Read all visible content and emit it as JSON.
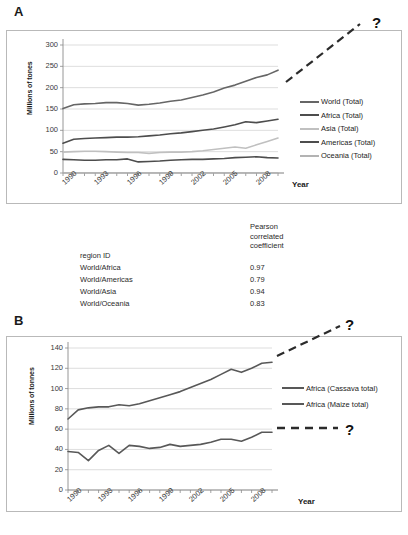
{
  "figure": {
    "panelA_letter": "A",
    "panelB_letter": "B",
    "question_mark": "?"
  },
  "table": {
    "col1_header": "region ID",
    "col2_header_line1": "Pearson",
    "col2_header_line2": "correlated",
    "col2_header_line3": "coefficient",
    "rows": [
      {
        "region": "World/Africa",
        "coefficient": "0.97"
      },
      {
        "region": "World/Americas",
        "coefficient": "0.79"
      },
      {
        "region": "World/Asia",
        "coefficient": "0.94"
      },
      {
        "region": "World/Oceania",
        "coefficient": "0.83"
      }
    ]
  },
  "chart_data": [
    {
      "id": "panelA",
      "type": "line",
      "title": "",
      "xlabel": "Year",
      "ylabel": "Millions of tones",
      "ylim": [
        0,
        300
      ],
      "yticks": [
        0,
        50,
        100,
        150,
        200,
        250,
        300
      ],
      "xlim": [
        1990,
        2010
      ],
      "xticks": [
        1990,
        1993,
        1996,
        1999,
        2002,
        2005,
        2008
      ],
      "x": [
        1990,
        1991,
        1992,
        1993,
        1994,
        1995,
        1996,
        1997,
        1998,
        1999,
        2000,
        2001,
        2002,
        2003,
        2004,
        2005,
        2006,
        2007,
        2008,
        2009,
        2010
      ],
      "grid": true,
      "legend_position": "right",
      "annotation": "?",
      "series": [
        {
          "name": "World (Total)",
          "color": "#666666",
          "width": 1.6,
          "values": [
            151,
            160,
            162,
            163,
            165,
            165,
            163,
            159,
            161,
            164,
            168,
            171,
            177,
            183,
            190,
            199,
            206,
            215,
            224,
            230,
            241
          ]
        },
        {
          "name": "Africa (Total)",
          "color": "#4d4d4d",
          "width": 1.6,
          "values": [
            70,
            79,
            81,
            82,
            83,
            84,
            84,
            85,
            87,
            89,
            92,
            94,
            97,
            100,
            103,
            108,
            113,
            120,
            118,
            122,
            126
          ]
        },
        {
          "name": "Asia (Total)",
          "color": "#c0c0c0",
          "width": 1.6,
          "values": [
            49,
            50,
            51,
            51,
            50,
            49,
            48,
            48,
            46,
            48,
            49,
            49,
            50,
            52,
            55,
            58,
            61,
            58,
            66,
            74,
            82
          ]
        },
        {
          "name": "Americas (Total)",
          "color": "#4d4d4d",
          "width": 1.6,
          "values": [
            32,
            31,
            30,
            30,
            31,
            31,
            33,
            26,
            27,
            28,
            30,
            31,
            32,
            32,
            33,
            34,
            36,
            37,
            38,
            36,
            35
          ]
        },
        {
          "name": "Oceania (Total)",
          "color": "#b3b3b3",
          "width": 1.2,
          "values": [
            0.3,
            0.3,
            0.3,
            0.3,
            0.3,
            0.3,
            0.3,
            0.3,
            0.3,
            0.3,
            0.3,
            0.3,
            0.3,
            0.3,
            0.3,
            0.3,
            0.3,
            0.3,
            0.3,
            0.3,
            0.3
          ]
        }
      ]
    },
    {
      "id": "panelB",
      "type": "line",
      "title": "",
      "xlabel": "Year",
      "ylabel": "Millions of tonnes",
      "ylim": [
        0,
        140
      ],
      "yticks": [
        0,
        20,
        40,
        60,
        80,
        100,
        120,
        140
      ],
      "xlim": [
        1990,
        2010
      ],
      "xticks": [
        1990,
        1993,
        1996,
        1999,
        2002,
        2005,
        2008
      ],
      "x": [
        1990,
        1991,
        1992,
        1993,
        1994,
        1995,
        1996,
        1997,
        1998,
        1999,
        2000,
        2001,
        2002,
        2003,
        2004,
        2005,
        2006,
        2007,
        2008,
        2009,
        2010
      ],
      "grid": true,
      "legend_position": "right",
      "annotation": "?",
      "series": [
        {
          "name": "Africa  (Cassava total)",
          "color": "#585858",
          "width": 1.6,
          "values": [
            70,
            79,
            81,
            82,
            82,
            84,
            83,
            85,
            88,
            91,
            94,
            97,
            101,
            105,
            109,
            114,
            119,
            116,
            120,
            125,
            126
          ]
        },
        {
          "name": "Africa  (Maize total)",
          "color": "#585858",
          "width": 1.6,
          "values": [
            38,
            37,
            29,
            39,
            44,
            36,
            44,
            43,
            41,
            42,
            45,
            43,
            44,
            45,
            47,
            50,
            50,
            48,
            52,
            57,
            57
          ]
        }
      ]
    }
  ]
}
